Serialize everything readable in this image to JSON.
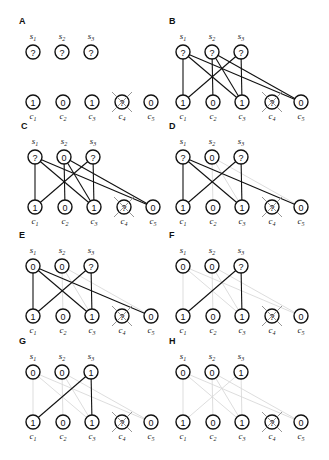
{
  "figure": {
    "node_radius": 7,
    "colors": {
      "dark_edge": "#111111",
      "light_edge": "#d9d9d9",
      "node_stroke": "#111111",
      "cross": "#8a8a8a"
    },
    "s_labels": [
      {
        "base": "s",
        "sub": "1"
      },
      {
        "base": "s",
        "sub": "2"
      },
      {
        "base": "s",
        "sub": "3"
      }
    ],
    "c_labels": [
      {
        "base": "c",
        "sub": "1"
      },
      {
        "base": "c",
        "sub": "2"
      },
      {
        "base": "c",
        "sub": "3"
      },
      {
        "base": "c",
        "sub": "4"
      },
      {
        "base": "c",
        "sub": "5"
      }
    ],
    "c_values": [
      "1",
      "0",
      "1",
      "?",
      "0"
    ],
    "crossed_clause": 4,
    "all_edges": [
      [
        1,
        1
      ],
      [
        1,
        3
      ],
      [
        1,
        5
      ],
      [
        2,
        2
      ],
      [
        2,
        3
      ],
      [
        2,
        5
      ],
      [
        3,
        1
      ],
      [
        3,
        3
      ]
    ],
    "panels": [
      {
        "label": "A",
        "origin": [
          0,
          0
        ],
        "s_values": [
          "?",
          "?",
          "?"
        ],
        "dark_edges": [],
        "light_edges": []
      },
      {
        "label": "B",
        "origin": [
          150,
          0
        ],
        "s_values": [
          "?",
          "?",
          "?"
        ],
        "dark_edges": [
          [
            1,
            1
          ],
          [
            1,
            3
          ],
          [
            1,
            5
          ],
          [
            2,
            2
          ],
          [
            2,
            3
          ],
          [
            2,
            5
          ],
          [
            3,
            1
          ],
          [
            3,
            3
          ]
        ],
        "light_edges": []
      },
      {
        "label": "C",
        "origin": [
          2,
          105
        ],
        "s_values": [
          "?",
          "0",
          "?"
        ],
        "dark_edges": [
          [
            1,
            1
          ],
          [
            1,
            3
          ],
          [
            1,
            5
          ],
          [
            2,
            2
          ],
          [
            2,
            3
          ],
          [
            2,
            5
          ],
          [
            3,
            1
          ],
          [
            3,
            3
          ]
        ],
        "light_edges": []
      },
      {
        "label": "D",
        "origin": [
          150,
          105
        ],
        "s_values": [
          "?",
          "0",
          "?"
        ],
        "dark_edges": [
          [
            1,
            1
          ],
          [
            1,
            3
          ],
          [
            1,
            5
          ],
          [
            3,
            1
          ],
          [
            3,
            3
          ]
        ],
        "light_edges": [
          [
            2,
            2
          ],
          [
            2,
            3
          ],
          [
            2,
            5
          ]
        ]
      },
      {
        "label": "E",
        "origin": [
          0,
          214
        ],
        "s_values": [
          "0",
          "0",
          "?"
        ],
        "dark_edges": [
          [
            1,
            1
          ],
          [
            1,
            3
          ],
          [
            1,
            5
          ],
          [
            3,
            1
          ],
          [
            3,
            3
          ]
        ],
        "light_edges": [
          [
            2,
            2
          ],
          [
            2,
            3
          ],
          [
            2,
            5
          ]
        ]
      },
      {
        "label": "F",
        "origin": [
          150,
          214
        ],
        "s_values": [
          "0",
          "0",
          "?"
        ],
        "dark_edges": [
          [
            3,
            1
          ],
          [
            3,
            3
          ]
        ],
        "light_edges": [
          [
            1,
            1
          ],
          [
            1,
            3
          ],
          [
            1,
            5
          ],
          [
            2,
            2
          ],
          [
            2,
            3
          ],
          [
            2,
            5
          ]
        ]
      },
      {
        "label": "G",
        "origin": [
          0,
          320
        ],
        "s_values": [
          "0",
          "0",
          "1"
        ],
        "dark_edges": [
          [
            3,
            1
          ],
          [
            3,
            3
          ]
        ],
        "light_edges": [
          [
            1,
            1
          ],
          [
            1,
            3
          ],
          [
            1,
            5
          ],
          [
            2,
            2
          ],
          [
            2,
            3
          ],
          [
            2,
            5
          ]
        ]
      },
      {
        "label": "H",
        "origin": [
          150,
          320
        ],
        "s_values": [
          "0",
          "0",
          "1"
        ],
        "dark_edges": [],
        "light_edges": [
          [
            1,
            1
          ],
          [
            1,
            3
          ],
          [
            1,
            5
          ],
          [
            2,
            2
          ],
          [
            2,
            3
          ],
          [
            2,
            5
          ],
          [
            3,
            1
          ],
          [
            3,
            3
          ]
        ]
      }
    ],
    "layout": {
      "label_pos": [
        19,
        24
      ],
      "s_x": [
        33,
        62,
        91
      ],
      "s_y": 52,
      "s_label_y": 39,
      "c_x": [
        33,
        63,
        92,
        122,
        151
      ],
      "c_y": 102,
      "c_label_y": 119
    }
  }
}
